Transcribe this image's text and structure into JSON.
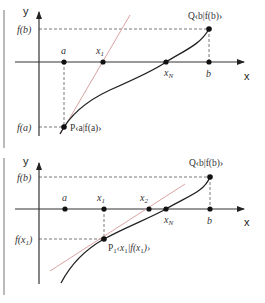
{
  "colors": {
    "axis": "#333333",
    "curve": "#222222",
    "secant": "#d9a3a3",
    "dash": "#555555",
    "point": "#111111"
  },
  "diagrams": [
    {
      "id": "top",
      "description": "Regula falsi first step: secant from P to Q intersecting x-axis at x1",
      "axis_labels": {
        "x": "x",
        "y": "y"
      },
      "y_ticks": {
        "fb": "f(b)",
        "fa": "f(a)"
      },
      "x_points": {
        "a": "a",
        "x1": "x",
        "x1_sub": "1",
        "xN": "x",
        "xN_sub": "N",
        "b": "b"
      },
      "point_P": "P‹a|f(a)›",
      "point_Q": "Q‹b|f(b)›"
    },
    {
      "id": "bottom",
      "description": "Regula falsi second step: secant from P1 to Q intersecting x-axis at x2",
      "axis_labels": {
        "x": "x",
        "y": "y"
      },
      "y_ticks": {
        "fb": "f(b)",
        "fx1": "f(x",
        "fx1_sub": "1",
        "fx1_end": ")"
      },
      "x_points": {
        "a": "a",
        "x1": "x",
        "x1_sub": "1",
        "x2": "x",
        "x2_sub": "2",
        "xN": "x",
        "xN_sub": "N",
        "b": "b"
      },
      "point_P1": "P",
      "point_P1_sub": "1",
      "point_P1_coords_a": "‹x",
      "point_P1_coords_sub": "1",
      "point_P1_coords_b": "|f(x",
      "point_P1_coords_sub2": "1",
      "point_P1_coords_c": ")›",
      "point_Q": "Q‹b|f(b)›"
    }
  ]
}
